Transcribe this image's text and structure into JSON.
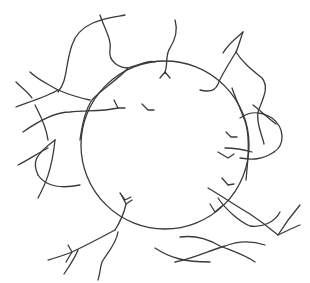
{
  "diagram": {
    "description": "Sphere (particle) surrounded by wavy polymer chains, some with branched ends grafted to the surface",
    "stroke_color": "#3a3a3a",
    "background": "#ffffff",
    "particle": {
      "cx": 165,
      "cy": 145,
      "r": 84
    },
    "chains": [
      "M125,15 C110,18 80,20 72,45 C65,65 68,80 58,92",
      "M100,15 C105,30 112,40 110,50 C108,62 120,68 128,68 C140,64 150,60 155,62",
      "M128,68 C118,80 100,90 92,100 C85,110 82,125 80,140",
      "M16,107 C35,100 50,95 58,90",
      "M30,72 C38,80 50,85 58,90 C70,95 80,98 90,100",
      "M16,82 C22,88 28,92 32,98",
      "M35,105 C40,115 46,125 48,140",
      "M23,132 C40,120 55,112 70,112 C85,110 100,112 118,108",
      "M118,108 L114,100 M118,108 L125,108",
      "M55,140 C35,155 32,162 38,175",
      "M38,175 C44,184 55,190 80,185",
      "M38,198 C45,185 52,170 55,140",
      "M175,20 C178,30 175,40 170,48 C165,55 168,65 165,72",
      "M165,72 L160,78 M165,72 L170,78",
      "M243,32 C236,38 228,44 223,53",
      "M243,32 C240,40 238,48 236,52",
      "M236,52 C230,62 222,74 218,84 C215,92 208,92 200,90",
      "M236,52 C242,62 252,70 262,78 C270,88 262,100 258,112 C256,124 262,134 264,144",
      "M232,88 C236,100 242,112 246,124 C250,140 248,160 246,180",
      "M240,118 C252,110 262,112 272,118 C285,128 285,145 274,152",
      "M274,152 C262,160 252,160 240,158",
      "M228,158 L218,152 M228,158 L234,154",
      "M225,148 C235,148 245,150 252,152",
      "M253,105 C262,112 268,118 276,124",
      "M228,185 L222,178 M228,185 L234,184",
      "M208,188 C220,195 235,205 250,214 C262,222 272,230 278,235 C285,232 292,228 300,225",
      "M278,235 C286,222 294,212 300,205",
      "M218,198 C226,210 240,222 250,226 C262,228 275,222 280,212",
      "M215,212 L222,206 M215,212 L210,204",
      "M180,237 C195,235 210,240 220,246 C235,252 245,255 255,262",
      "M175,262 C195,258 210,250 225,246 C235,242 250,240 265,245",
      "M155,248 C170,258 185,262 210,262",
      "M126,204 C124,214 120,222 115,230",
      "M126,204 L122,196 M126,204 L132,200",
      "M115,230 C100,238 85,246 72,252 C62,256 55,258 48,260",
      "M72,252 L66,262 M72,252 L68,245",
      "M118,232 C116,244 108,252 102,262 C100,268 100,274 98,280",
      "M64,274 C70,265 75,258 78,250",
      "M18,165 C28,160 40,152 48,148"
    ],
    "branch_tips": [
      "M148,110 L142,104 M148,110 L154,110",
      "M125,200 L120,193 M125,200 L131,197",
      "M231,137 L226,132 M231,137 L237,137"
    ]
  }
}
